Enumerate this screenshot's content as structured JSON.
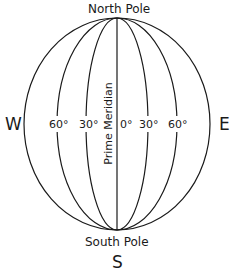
{
  "diagram": {
    "title_top": "North Pole",
    "title_bottom": "South Pole",
    "directions": {
      "west": "W",
      "east": "E",
      "south": "S"
    },
    "meridian_label": "Prime Meridian",
    "longitudes": [
      "60°",
      "30°",
      "0°",
      "30°",
      "60°"
    ],
    "stroke_color": "#1a1a1a"
  }
}
